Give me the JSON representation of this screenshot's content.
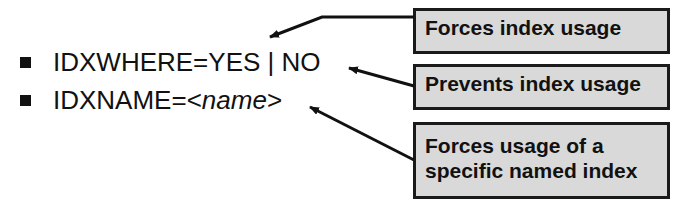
{
  "options": [
    {
      "prefix": "IDXWHERE=YES | NO",
      "italic": "",
      "suffix": ""
    },
    {
      "prefix": "IDXNAME=<",
      "italic": "name",
      "suffix": ">"
    }
  ],
  "callouts": [
    {
      "text": "Forces index usage",
      "target": "IDXWHERE=YES"
    },
    {
      "text": "Prevents index usage",
      "target": "IDXWHERE=NO"
    },
    {
      "text_line1": "Forces usage of a",
      "text_line2": "specific named index",
      "target": "IDXNAME"
    }
  ],
  "colors": {
    "box_fill": "#d9d9d9",
    "border": "#1a1a1a",
    "text": "#111111"
  }
}
